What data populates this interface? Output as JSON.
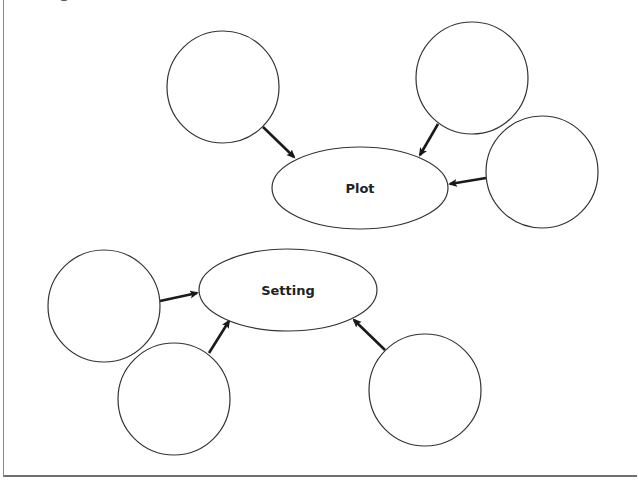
{
  "organizer": {
    "type": "story-elements-graphic-organizer",
    "colors": {
      "stroke": "#333333",
      "arrow": "#1a1a1a",
      "text": "#222222",
      "frame": "#7a7a7a",
      "background": "#ffffff"
    },
    "hubs": [
      {
        "id": "plot",
        "label": "Plot",
        "cx": 360,
        "cy": 188,
        "rx": 88,
        "ry": 41,
        "feeders": [
          {
            "id": "plot-detail-1",
            "cx": 223,
            "cy": 87,
            "r": 56,
            "text": ""
          },
          {
            "id": "plot-detail-2",
            "cx": 472,
            "cy": 78,
            "r": 56,
            "text": ""
          },
          {
            "id": "plot-detail-3",
            "cx": 542,
            "cy": 172,
            "r": 56,
            "text": ""
          }
        ]
      },
      {
        "id": "setting",
        "label": "Setting",
        "cx": 288,
        "cy": 290,
        "rx": 89,
        "ry": 41,
        "feeders": [
          {
            "id": "setting-detail-1",
            "cx": 104,
            "cy": 306,
            "r": 56,
            "text": ""
          },
          {
            "id": "setting-detail-2",
            "cx": 174,
            "cy": 399,
            "r": 56,
            "text": ""
          },
          {
            "id": "setting-detail-3",
            "cx": 425,
            "cy": 390,
            "r": 56,
            "text": ""
          }
        ]
      }
    ],
    "arrows": [
      {
        "from": "plot-detail-1",
        "to": "plot",
        "x1": 263,
        "y1": 127,
        "x2": 294,
        "y2": 157
      },
      {
        "from": "plot-detail-2",
        "to": "plot",
        "x1": 438,
        "y1": 124,
        "x2": 420,
        "y2": 155
      },
      {
        "from": "plot-detail-3",
        "to": "plot",
        "x1": 486,
        "y1": 178,
        "x2": 450,
        "y2": 184
      },
      {
        "from": "setting-detail-1",
        "to": "setting",
        "x1": 160,
        "y1": 301,
        "x2": 197,
        "y2": 293
      },
      {
        "from": "setting-detail-2",
        "to": "setting",
        "x1": 209,
        "y1": 353,
        "x2": 229,
        "y2": 321
      },
      {
        "from": "setting-detail-3",
        "to": "setting",
        "x1": 385,
        "y1": 350,
        "x2": 354,
        "y2": 320
      }
    ]
  }
}
